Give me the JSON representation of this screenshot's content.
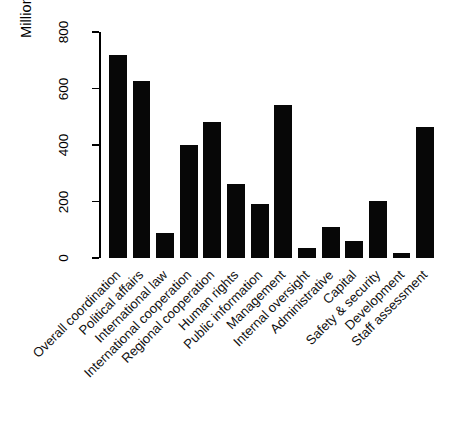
{
  "chart_data": {
    "type": "bar",
    "title": "",
    "subtitle": "",
    "xlabel": "",
    "ylabel": "Millions of US Dollars",
    "ylim": [
      0,
      800
    ],
    "yticks": [
      0,
      200,
      400,
      600,
      800
    ],
    "grid": false,
    "legend": false,
    "legend_position": "none",
    "bar_color": "#070707",
    "axis_color": "#000000",
    "categories": [
      "Overall coordination",
      "Political affairs",
      "International law",
      "International cooperation",
      "Regional cooperation",
      "Human rights",
      "Public information",
      "Management",
      "Internal oversight",
      "Administrative",
      "Capital",
      "Safety & security",
      "Development",
      "Staff assessment"
    ],
    "values": [
      720,
      628,
      90,
      400,
      480,
      263,
      190,
      543,
      35,
      110,
      60,
      202,
      18,
      465
    ]
  }
}
